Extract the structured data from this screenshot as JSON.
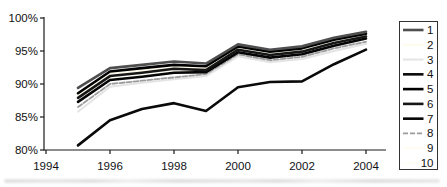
{
  "figure": {
    "background": "#ffffff",
    "axis_color": "#1a1a1a",
    "text_color": "#111111"
  },
  "chart_data": {
    "type": "line",
    "title": "",
    "xlabel": "",
    "ylabel": "",
    "grid": false,
    "legend_position": "right",
    "xlim": [
      1994,
      2004.7
    ],
    "ylim": [
      80,
      100
    ],
    "y_tick_labels": [
      "100%",
      "95%",
      "90%",
      "85%",
      "80%"
    ],
    "y_tick_values": [
      100,
      95,
      90,
      85,
      80
    ],
    "x_tick_labels": [
      "1994",
      "1996",
      "1998",
      "2000",
      "2002",
      "2004"
    ],
    "x_tick_values": [
      1994,
      1996,
      1998,
      2000,
      2002,
      2004
    ],
    "x": [
      1995,
      1996,
      1997,
      1998,
      1999,
      2000,
      2001,
      2002,
      2003,
      2004
    ],
    "series": [
      {
        "name": "1",
        "color": "#4f4f4f",
        "width": 2.6,
        "dash": "",
        "values": [
          89.4,
          92.4,
          92.9,
          93.4,
          93.1,
          96.0,
          95.2,
          95.7,
          97.0,
          97.9
        ]
      },
      {
        "name": "2",
        "color": "#fffbea",
        "width": 2.0,
        "dash": "",
        "values": [
          88.2,
          91.5,
          92.0,
          92.5,
          92.4,
          95.4,
          94.6,
          95.1,
          96.4,
          97.4
        ]
      },
      {
        "name": "3",
        "color": "#e4e4e4",
        "width": 2.0,
        "dash": "",
        "values": [
          85.8,
          89.6,
          90.2,
          90.7,
          91.2,
          94.2,
          93.3,
          93.8,
          95.0,
          96.1
        ]
      },
      {
        "name": "4",
        "color": "#0a0a0a",
        "width": 2.6,
        "dash": "",
        "values": [
          80.7,
          84.5,
          86.2,
          87.1,
          85.9,
          89.5,
          90.3,
          90.4,
          93.0,
          95.2
        ]
      },
      {
        "name": "5",
        "color": "#000000",
        "width": 2.6,
        "dash": "",
        "values": [
          88.6,
          91.9,
          92.4,
          92.9,
          92.7,
          95.7,
          94.9,
          95.4,
          96.7,
          97.6
        ]
      },
      {
        "name": "6",
        "color": "#161616",
        "width": 2.6,
        "dash": "",
        "values": [
          87.9,
          91.2,
          91.7,
          92.3,
          92.1,
          95.2,
          94.4,
          94.9,
          96.2,
          97.2
        ]
      },
      {
        "name": "7",
        "color": "#050505",
        "width": 2.6,
        "dash": "",
        "values": [
          87.3,
          90.6,
          91.1,
          91.7,
          91.8,
          94.8,
          94.0,
          94.5,
          95.8,
          96.9
        ]
      },
      {
        "name": "8",
        "color": "#9c9c9c",
        "width": 1.8,
        "dash": "5 2",
        "values": [
          86.5,
          90.0,
          90.5,
          91.0,
          91.5,
          94.5,
          93.6,
          94.1,
          95.4,
          96.4
        ]
      },
      {
        "name": "9",
        "color": "#fffdf2",
        "width": 2.0,
        "dash": "",
        "values": [
          88.0,
          91.0,
          91.5,
          92.0,
          92.0,
          95.0,
          94.2,
          94.7,
          96.0,
          97.0
        ]
      },
      {
        "name": "10",
        "color": "#fffef6",
        "width": 2.0,
        "dash": "",
        "values": [
          87.6,
          90.9,
          91.4,
          91.9,
          91.9,
          95.1,
          94.3,
          94.8,
          96.1,
          97.1
        ]
      }
    ],
    "legend_labels": [
      "1",
      "2",
      "3",
      "4",
      "5",
      "6",
      "7",
      "8",
      "9",
      "10"
    ]
  }
}
